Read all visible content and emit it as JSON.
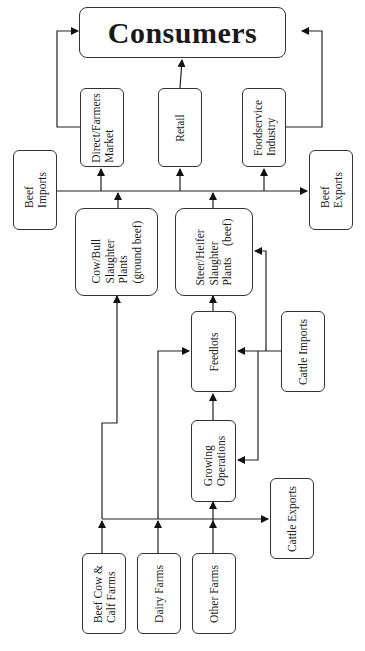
{
  "diagram": {
    "title": "Consumers",
    "nodes": {
      "consumers": {
        "label": "Consumers"
      },
      "direct_farmers_market": {
        "lines": [
          "Direct/Farmers",
          "Market"
        ]
      },
      "retail": {
        "lines": [
          "Retail"
        ]
      },
      "foodservice": {
        "lines": [
          "Foodservice",
          "Industry"
        ]
      },
      "beef_imports": {
        "lines": [
          "Beef",
          "Imports"
        ]
      },
      "beef_exports": {
        "lines": [
          "Beef",
          "Exports"
        ]
      },
      "cow_bull": {
        "lines": [
          "Cow/Bull",
          "Slaughter",
          "Plants",
          "(ground beef)"
        ]
      },
      "steer_heifer": {
        "lines": [
          "Steer/Heifer",
          "Slaughter",
          "Plants    (beef)"
        ]
      },
      "feedlots": {
        "lines": [
          "Feedlots"
        ]
      },
      "cattle_imports": {
        "lines": [
          "Cattle Imports"
        ]
      },
      "growing_operations": {
        "lines": [
          "Growing",
          "Operations"
        ]
      },
      "cattle_exports": {
        "lines": [
          "Cattle Exports"
        ]
      },
      "beef_cow_calf": {
        "lines": [
          "Beef Cow &",
          "Calf Farms"
        ]
      },
      "dairy_farms": {
        "lines": [
          "Dairy Farms"
        ]
      },
      "other_farms": {
        "lines": [
          "Other Farms"
        ]
      }
    },
    "edges": [
      [
        "direct_farmers_market",
        "consumers"
      ],
      [
        "retail",
        "consumers"
      ],
      [
        "foodservice",
        "consumers"
      ],
      [
        "beef_imports",
        "direct_farmers_market"
      ],
      [
        "beef_imports",
        "retail"
      ],
      [
        "beef_imports",
        "foodservice"
      ],
      [
        "beef_imports",
        "beef_exports"
      ],
      [
        "cow_bull",
        "distribution"
      ],
      [
        "steer_heifer",
        "distribution"
      ],
      [
        "beef_cow_calf",
        "cow_bull"
      ],
      [
        "beef_cow_calf",
        "cattle_exports"
      ],
      [
        "dairy_farms",
        "feedlots"
      ],
      [
        "other_farms",
        "growing_operations"
      ],
      [
        "growing_operations",
        "feedlots"
      ],
      [
        "feedlots",
        "steer_heifer"
      ],
      [
        "cattle_imports",
        "feedlots"
      ],
      [
        "cattle_imports",
        "growing_operations"
      ],
      [
        "cattle_imports",
        "steer_heifer"
      ]
    ],
    "colors": {
      "line": "#222222",
      "border": "#333333",
      "background": "#ffffff"
    }
  }
}
